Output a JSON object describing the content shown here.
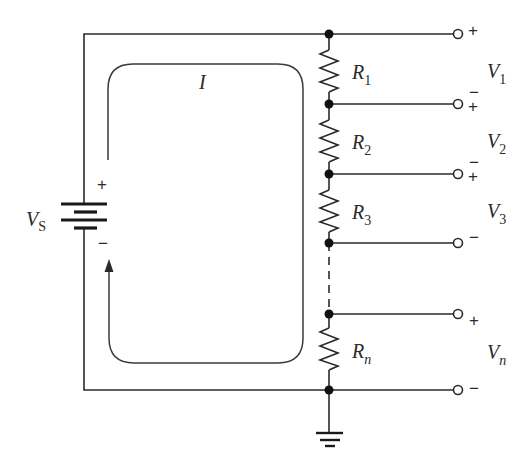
{
  "diagram": {
    "type": "series-circuit-voltage-divider",
    "source": {
      "label_main": "V",
      "label_sub": "S",
      "plus_sign": "+",
      "minus_sign": "−"
    },
    "current": {
      "label": "I"
    },
    "resistors": [
      {
        "label_main": "R",
        "label_sub": "1"
      },
      {
        "label_main": "R",
        "label_sub": "2"
      },
      {
        "label_main": "R",
        "label_sub": "3"
      },
      {
        "label_main": "R",
        "label_sub": "n"
      }
    ],
    "outputs": [
      {
        "label_main": "V",
        "label_sub": "1",
        "top_sign": "+",
        "bottom_sign": "−"
      },
      {
        "label_main": "V",
        "label_sub": "2",
        "top_sign": "+",
        "bottom_sign": "−"
      },
      {
        "label_main": "V",
        "label_sub": "3",
        "top_sign": "+",
        "bottom_sign": "−"
      },
      {
        "label_main": "V",
        "label_sub": "n",
        "top_sign": "+",
        "bottom_sign": "−"
      }
    ],
    "terminal_signs": {
      "t0": "+",
      "t1_top": "−",
      "t1_bottom": "+",
      "t2_top": "−",
      "t2_bottom": "+",
      "t3": "−",
      "t4": "+",
      "t5": "−"
    },
    "ground": {
      "label": "ground"
    },
    "colors": {
      "line": "#2a2a2a",
      "background": "#ffffff"
    }
  }
}
